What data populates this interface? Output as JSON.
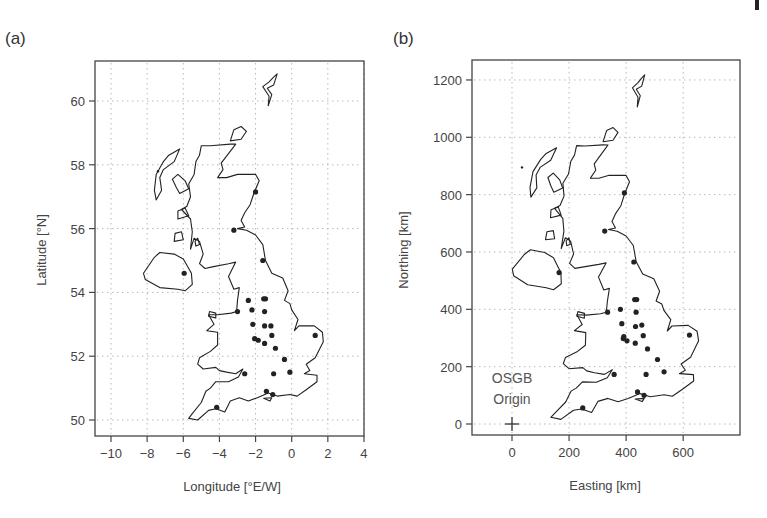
{
  "figure": {
    "width": 767,
    "height": 518,
    "corner_mark": {
      "x": 755,
      "y": 0,
      "w": 4,
      "h": 10
    }
  },
  "chart_data": [
    {
      "type": "scatter",
      "panel_label": "(a)",
      "title": "",
      "xlabel": "Longitude [°E/W]",
      "ylabel": "Latitude [°N]",
      "xlim": [
        -10.9,
        4
      ],
      "ylim": [
        49.6,
        61.3
      ],
      "xticks": [
        -10,
        -8,
        -6,
        -4,
        -2,
        0,
        2,
        4
      ],
      "xtick_labels": [
        "−10",
        "−8",
        "−6",
        "−4",
        "−2",
        "0",
        "2",
        "4"
      ],
      "yticks": [
        50,
        52,
        54,
        56,
        58,
        60
      ],
      "ytick_labels": [
        "50",
        "52",
        "54",
        "56",
        "58",
        "60"
      ],
      "grid": true,
      "grid_style": "dotted",
      "legend": null,
      "layers": [
        "UK and Ireland coastline outline",
        "station points"
      ],
      "frame_px": {
        "left": 95,
        "top": 61,
        "right": 364,
        "bottom": 436
      },
      "stations": [
        {
          "lon": -3.2,
          "lat": 55.95
        },
        {
          "lon": -1.6,
          "lat": 55.0
        },
        {
          "lon": -2.0,
          "lat": 57.15
        },
        {
          "lon": -1.55,
          "lat": 53.8
        },
        {
          "lon": -1.45,
          "lat": 53.8
        },
        {
          "lon": -2.4,
          "lat": 53.75
        },
        {
          "lon": -2.2,
          "lat": 53.45
        },
        {
          "lon": -1.5,
          "lat": 53.4
        },
        {
          "lon": -2.15,
          "lat": 53.0
        },
        {
          "lon": -1.5,
          "lat": 52.95
        },
        {
          "lon": -1.15,
          "lat": 52.95
        },
        {
          "lon": -1.1,
          "lat": 52.65
        },
        {
          "lon": -2.05,
          "lat": 52.55
        },
        {
          "lon": -1.85,
          "lat": 52.5
        },
        {
          "lon": -1.5,
          "lat": 52.4
        },
        {
          "lon": -0.9,
          "lat": 52.25
        },
        {
          "lon": -0.4,
          "lat": 51.9
        },
        {
          "lon": -0.1,
          "lat": 51.5
        },
        {
          "lon": -1.0,
          "lat": 51.45
        },
        {
          "lon": 1.3,
          "lat": 52.65
        },
        {
          "lon": -1.4,
          "lat": 50.9
        },
        {
          "lon": -1.05,
          "lat": 50.8
        },
        {
          "lon": -4.15,
          "lat": 50.4
        },
        {
          "lon": -2.6,
          "lat": 51.45
        },
        {
          "lon": -5.95,
          "lat": 54.6
        },
        {
          "lon": -3.0,
          "lat": 53.4
        },
        {
          "lon": -7.4,
          "lat": 57.8
        }
      ]
    },
    {
      "type": "scatter",
      "panel_label": "(b)",
      "title": "",
      "xlabel": "Easting [km]",
      "ylabel": "Northing [km]",
      "xlim": [
        -140,
        800
      ],
      "ylim": [
        -40,
        1260
      ],
      "xticks": [
        0,
        200,
        400,
        600
      ],
      "xtick_labels": [
        "0",
        "200",
        "400",
        "600"
      ],
      "yticks": [
        0,
        200,
        400,
        600,
        800,
        1000,
        1200
      ],
      "ytick_labels": [
        "0",
        "200",
        "400",
        "600",
        "800",
        "1000",
        "1200"
      ],
      "grid": true,
      "grid_style": "dotted",
      "legend": null,
      "annotations": [
        {
          "text": "OSGB",
          "x": 0,
          "y": 148
        },
        {
          "text": "Origin",
          "x": 0,
          "y": 80
        },
        {
          "marker": "+",
          "x": 0,
          "y": 0,
          "label": "OSGB Origin"
        }
      ],
      "layers": [
        "UK and Ireland coastline outline (OSGB projection)",
        "station points"
      ],
      "frame_px": {
        "left": 472,
        "top": 60,
        "right": 740,
        "bottom": 435
      },
      "stations": [
        {
          "e": 325,
          "n": 673
        },
        {
          "e": 427,
          "n": 565
        },
        {
          "e": 394,
          "n": 806
        },
        {
          "e": 430,
          "n": 434
        },
        {
          "e": 437,
          "n": 434
        },
        {
          "e": 380,
          "n": 400
        },
        {
          "e": 385,
          "n": 350
        },
        {
          "e": 435,
          "n": 390
        },
        {
          "e": 392,
          "n": 305
        },
        {
          "e": 433,
          "n": 340
        },
        {
          "e": 455,
          "n": 345
        },
        {
          "e": 460,
          "n": 308
        },
        {
          "e": 390,
          "n": 298
        },
        {
          "e": 403,
          "n": 290
        },
        {
          "e": 432,
          "n": 282
        },
        {
          "e": 475,
          "n": 262
        },
        {
          "e": 510,
          "n": 225
        },
        {
          "e": 533,
          "n": 182
        },
        {
          "e": 470,
          "n": 173
        },
        {
          "e": 622,
          "n": 310
        },
        {
          "e": 440,
          "n": 112
        },
        {
          "e": 463,
          "n": 100
        },
        {
          "e": 248,
          "n": 56
        },
        {
          "e": 358,
          "n": 173
        },
        {
          "e": 165,
          "n": 528
        },
        {
          "e": 335,
          "n": 390
        },
        {
          "e": 35,
          "n": 895
        }
      ]
    }
  ],
  "outlines": {
    "gb": [
      [
        -5.7,
        50.05
      ],
      [
        -5.2,
        50.0
      ],
      [
        -4.6,
        50.3
      ],
      [
        -4.2,
        50.35
      ],
      [
        -3.7,
        50.25
      ],
      [
        -3.4,
        50.6
      ],
      [
        -2.9,
        50.7
      ],
      [
        -2.4,
        50.6
      ],
      [
        -1.9,
        50.7
      ],
      [
        -1.3,
        50.85
      ],
      [
        -0.8,
        50.75
      ],
      [
        -0.1,
        50.8
      ],
      [
        0.3,
        50.75
      ],
      [
        0.8,
        50.95
      ],
      [
        1.4,
        51.2
      ],
      [
        1.4,
        51.4
      ],
      [
        0.7,
        51.45
      ],
      [
        1.0,
        51.55
      ],
      [
        0.8,
        51.75
      ],
      [
        1.3,
        51.95
      ],
      [
        1.75,
        52.45
      ],
      [
        1.7,
        52.75
      ],
      [
        1.25,
        52.95
      ],
      [
        0.4,
        52.95
      ],
      [
        0.15,
        52.8
      ],
      [
        0.35,
        53.15
      ],
      [
        0.0,
        53.45
      ],
      [
        -0.1,
        53.65
      ],
      [
        -0.4,
        53.75
      ],
      [
        -0.2,
        54.05
      ],
      [
        -0.5,
        54.45
      ],
      [
        -1.1,
        54.6
      ],
      [
        -1.45,
        55.0
      ],
      [
        -1.6,
        55.5
      ],
      [
        -2.0,
        55.8
      ],
      [
        -2.5,
        55.95
      ],
      [
        -3.0,
        56.0
      ],
      [
        -2.6,
        56.05
      ],
      [
        -2.8,
        56.25
      ],
      [
        -2.6,
        56.5
      ],
      [
        -2.3,
        56.75
      ],
      [
        -2.1,
        57.1
      ],
      [
        -1.8,
        57.5
      ],
      [
        -2.0,
        57.7
      ],
      [
        -3.0,
        57.7
      ],
      [
        -3.6,
        57.6
      ],
      [
        -4.1,
        57.6
      ],
      [
        -3.8,
        57.85
      ],
      [
        -3.9,
        58.05
      ],
      [
        -3.3,
        58.5
      ],
      [
        -3.1,
        58.65
      ],
      [
        -3.4,
        58.65
      ],
      [
        -4.5,
        58.6
      ],
      [
        -5.0,
        58.6
      ],
      [
        -5.1,
        58.3
      ],
      [
        -5.3,
        58.1
      ],
      [
        -5.4,
        57.7
      ],
      [
        -5.7,
        57.4
      ],
      [
        -5.6,
        57.0
      ],
      [
        -5.8,
        56.7
      ],
      [
        -6.1,
        56.6
      ],
      [
        -5.6,
        56.3
      ],
      [
        -5.5,
        55.9
      ],
      [
        -5.6,
        55.35
      ],
      [
        -5.4,
        55.7
      ],
      [
        -5.1,
        55.6
      ],
      [
        -4.9,
        55.2
      ],
      [
        -5.1,
        54.9
      ],
      [
        -4.8,
        54.75
      ],
      [
        -4.4,
        54.8
      ],
      [
        -3.5,
        54.9
      ],
      [
        -3.1,
        54.95
      ],
      [
        -3.5,
        54.5
      ],
      [
        -3.2,
        54.1
      ],
      [
        -2.9,
        54.15
      ],
      [
        -3.0,
        53.75
      ],
      [
        -3.05,
        53.4
      ],
      [
        -3.35,
        53.35
      ],
      [
        -4.1,
        53.3
      ],
      [
        -4.6,
        53.3
      ],
      [
        -4.3,
        53.0
      ],
      [
        -4.7,
        52.8
      ],
      [
        -4.1,
        52.75
      ],
      [
        -4.1,
        52.35
      ],
      [
        -4.5,
        52.15
      ],
      [
        -5.1,
        51.95
      ],
      [
        -5.2,
        51.75
      ],
      [
        -4.9,
        51.6
      ],
      [
        -4.2,
        51.65
      ],
      [
        -4.0,
        51.55
      ],
      [
        -3.6,
        51.5
      ],
      [
        -3.1,
        51.45
      ],
      [
        -2.7,
        51.6
      ],
      [
        -2.95,
        51.35
      ],
      [
        -3.5,
        51.2
      ],
      [
        -4.2,
        51.2
      ],
      [
        -4.5,
        51.0
      ],
      [
        -4.75,
        50.9
      ],
      [
        -5.0,
        50.55
      ],
      [
        -5.5,
        50.2
      ],
      [
        -5.7,
        50.05
      ]
    ],
    "ni": [
      [
        -5.5,
        54.25
      ],
      [
        -5.9,
        54.05
      ],
      [
        -6.3,
        54.1
      ],
      [
        -7.3,
        54.15
      ],
      [
        -8.1,
        54.4
      ],
      [
        -8.2,
        54.6
      ],
      [
        -7.6,
        55.1
      ],
      [
        -7.3,
        55.25
      ],
      [
        -6.5,
        55.2
      ],
      [
        -6.0,
        55.05
      ],
      [
        -5.8,
        54.85
      ],
      [
        -5.55,
        54.6
      ],
      [
        -5.5,
        54.25
      ]
    ],
    "hebrides": [
      [
        -7.5,
        56.9
      ],
      [
        -7.2,
        57.2
      ],
      [
        -7.3,
        57.6
      ],
      [
        -7.1,
        57.85
      ],
      [
        -6.5,
        58.1
      ],
      [
        -6.2,
        58.5
      ],
      [
        -6.8,
        58.3
      ],
      [
        -7.1,
        58.1
      ],
      [
        -7.5,
        57.7
      ],
      [
        -7.6,
        57.2
      ],
      [
        -7.5,
        56.9
      ]
    ],
    "skye": [
      [
        -6.2,
        57.1
      ],
      [
        -5.7,
        57.25
      ],
      [
        -5.9,
        57.5
      ],
      [
        -6.3,
        57.7
      ],
      [
        -6.6,
        57.55
      ],
      [
        -6.4,
        57.3
      ],
      [
        -6.2,
        57.1
      ]
    ],
    "mull": [
      [
        -6.3,
        56.3
      ],
      [
        -5.7,
        56.4
      ],
      [
        -5.9,
        56.65
      ],
      [
        -6.3,
        56.55
      ],
      [
        -6.3,
        56.3
      ]
    ],
    "islay": [
      [
        -6.5,
        55.6
      ],
      [
        -6.0,
        55.65
      ],
      [
        -6.1,
        55.9
      ],
      [
        -6.45,
        55.85
      ],
      [
        -6.5,
        55.6
      ]
    ],
    "arran": [
      [
        -5.3,
        55.45
      ],
      [
        -5.1,
        55.5
      ],
      [
        -5.2,
        55.7
      ],
      [
        -5.35,
        55.6
      ],
      [
        -5.3,
        55.45
      ]
    ],
    "orkney": [
      [
        -3.4,
        58.75
      ],
      [
        -2.8,
        58.8
      ],
      [
        -2.5,
        59.05
      ],
      [
        -2.8,
        59.2
      ],
      [
        -3.2,
        59.1
      ],
      [
        -3.4,
        58.75
      ]
    ],
    "shetland": [
      [
        -1.3,
        59.85
      ],
      [
        -1.1,
        60.2
      ],
      [
        -1.35,
        60.4
      ],
      [
        -1.0,
        60.5
      ],
      [
        -0.8,
        60.85
      ],
      [
        -1.0,
        60.75
      ],
      [
        -1.25,
        60.6
      ],
      [
        -1.6,
        60.45
      ],
      [
        -1.25,
        60.15
      ],
      [
        -1.3,
        59.85
      ]
    ],
    "anglesey": [
      [
        -4.2,
        53.2
      ],
      [
        -4.6,
        53.25
      ],
      [
        -4.55,
        53.4
      ],
      [
        -4.2,
        53.35
      ],
      [
        -4.2,
        53.2
      ]
    ],
    "wight": [
      [
        -1.55,
        50.68
      ],
      [
        -1.1,
        50.7
      ],
      [
        -1.2,
        50.6
      ],
      [
        -1.55,
        50.68
      ]
    ]
  }
}
